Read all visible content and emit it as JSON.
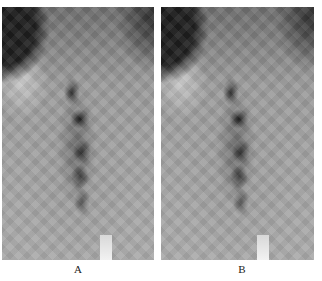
{
  "figure": {
    "panels": [
      {
        "id": "A",
        "label": "A"
      },
      {
        "id": "B",
        "label": "B"
      }
    ],
    "colors": {
      "background": "#ffffff",
      "image_tone": "#8a8a8a",
      "label_text": "#222222"
    }
  }
}
